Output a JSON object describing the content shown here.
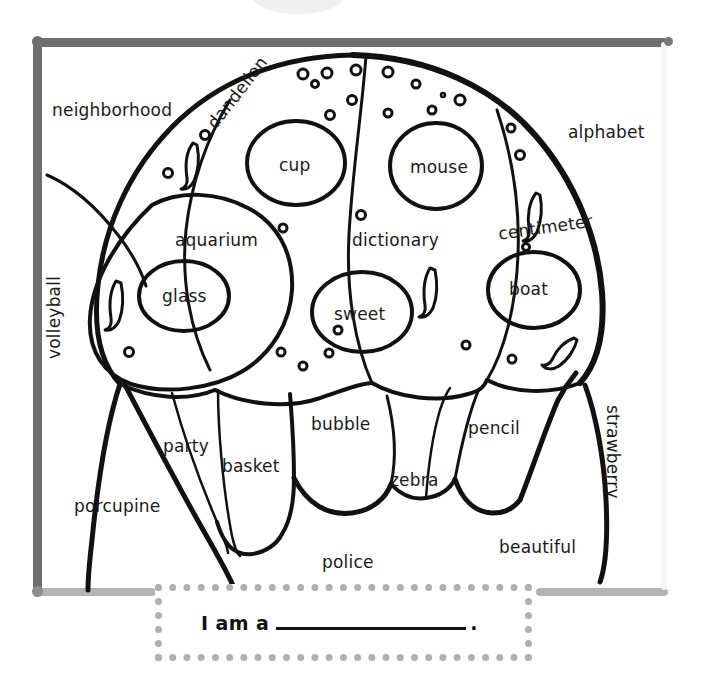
{
  "worksheet": {
    "title": "Ladybug Color-by-Word Coloring Page",
    "frame_color": "#6e6e6e",
    "frame_color_light": "#b4b4b4",
    "ink_color": "#111111"
  },
  "labels": {
    "neighborhood": "neighborhood",
    "alphabet": "alphabet",
    "dandelion": "dandelion",
    "cup": "cup",
    "mouse": "mouse",
    "centimeter": "centimeter",
    "aquarium": "aquarium",
    "dictionary": "dictionary",
    "glass": "glass",
    "sweet": "sweet",
    "boat": "boat",
    "volleyball": "volleyball",
    "strawberry": "strawberry",
    "bubble": "bubble",
    "party": "party",
    "pencil": "pencil",
    "basket": "basket",
    "zebra": "zebra",
    "porcupine": "porcupine",
    "beautiful": "beautiful",
    "police": "police"
  },
  "answer_prompt": {
    "label": "I am a",
    "blank_value": "",
    "blank_placeholder": "",
    "period": "."
  }
}
